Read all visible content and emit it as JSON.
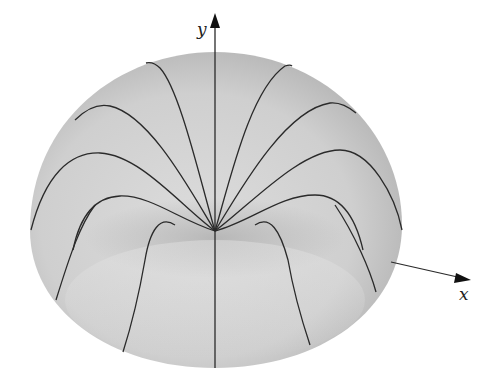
{
  "figure": {
    "surface_color": "#d6d6d6",
    "curve_color": "#2a2a2a",
    "axes": {
      "y_label": "y",
      "x_label": "x"
    },
    "meridian_count": 13
  }
}
